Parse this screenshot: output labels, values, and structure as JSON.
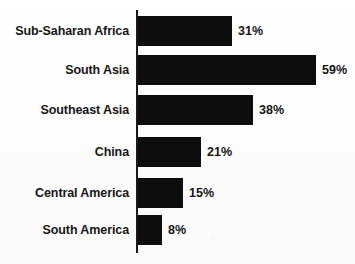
{
  "chart_data": {
    "type": "bar",
    "orientation": "horizontal",
    "title": "",
    "xlabel": "",
    "ylabel": "",
    "xlim": [
      0,
      59
    ],
    "grid": false,
    "legend": null,
    "value_suffix": "%",
    "categories": [
      "Sub-Saharan Africa",
      "South Asia",
      "Southeast Asia",
      "China",
      "Central America",
      "South America"
    ],
    "values": [
      31,
      59,
      38,
      21,
      15,
      8
    ],
    "value_labels": [
      "31%",
      "59%",
      "38%",
      "21%",
      "15%",
      "8%"
    ],
    "colors": {
      "bar": "#0d0d0d",
      "axis": "#1a1a1a",
      "text": "#161616",
      "background": "#fdfdfd"
    }
  }
}
